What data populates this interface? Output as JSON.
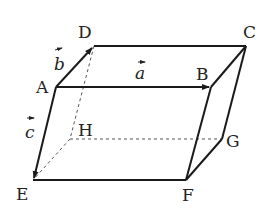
{
  "diagram": {
    "type": "parallelepiped",
    "vertices": {
      "A": {
        "label": "A",
        "x": 56,
        "y": 87
      },
      "B": {
        "label": "B",
        "x": 211,
        "y": 87
      },
      "C": {
        "label": "C",
        "x": 246,
        "y": 46
      },
      "D": {
        "label": "D",
        "x": 94,
        "y": 46
      },
      "E": {
        "label": "E",
        "x": 33,
        "y": 180
      },
      "F": {
        "label": "F",
        "x": 186,
        "y": 180
      },
      "G": {
        "label": "G",
        "x": 222,
        "y": 139
      },
      "H": {
        "label": "H",
        "x": 70,
        "y": 139
      }
    },
    "vectors": {
      "a": {
        "label": "a",
        "from": "A",
        "to": "B"
      },
      "b": {
        "label": "b",
        "from": "A",
        "to": "D"
      },
      "c": {
        "label": "c",
        "from": "A",
        "to": "E"
      }
    },
    "hidden_edges": [
      "D-H",
      "H-E",
      "H-G"
    ],
    "colors": {
      "line": "#1a1a1a",
      "dashed": "#555555"
    }
  }
}
